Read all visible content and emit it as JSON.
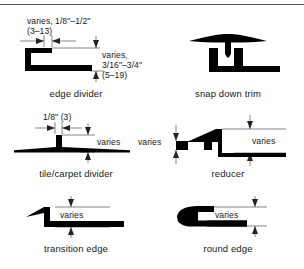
{
  "figure": {
    "title_rule": true,
    "ink_color": "#000000",
    "dimension_line_color": "#555555",
    "background": "#ffffff"
  },
  "panels": [
    {
      "id": "edge-divider",
      "caption": "edge divider",
      "annotations": [
        {
          "id": "width-note",
          "lines": [
            "varies, 1/8\"–1/2\"",
            "(3–13)"
          ]
        },
        {
          "id": "height-note",
          "lines": [
            "varies,",
            "3/16\"–3/4\"",
            "(5–19)"
          ]
        }
      ]
    },
    {
      "id": "snap-down-trim",
      "caption": "snap down trim",
      "annotations": []
    },
    {
      "id": "tile-carpet-divider",
      "caption": "tile/carpet divider",
      "annotations": [
        {
          "id": "width-note",
          "lines": [
            "1/8\" (3)"
          ]
        },
        {
          "id": "height-note",
          "lines": [
            "varies"
          ]
        }
      ]
    },
    {
      "id": "reducer",
      "caption": "reducer",
      "annotations": [
        {
          "id": "left-height-note",
          "lines": [
            "varies"
          ]
        },
        {
          "id": "right-height-note",
          "lines": [
            "varies"
          ]
        }
      ]
    },
    {
      "id": "transition-edge",
      "caption": "transition edge",
      "annotations": [
        {
          "id": "height-note",
          "lines": [
            "varies"
          ]
        }
      ]
    },
    {
      "id": "round-edge",
      "caption": "round edge",
      "annotations": [
        {
          "id": "height-note",
          "lines": [
            "varies"
          ]
        }
      ]
    }
  ]
}
